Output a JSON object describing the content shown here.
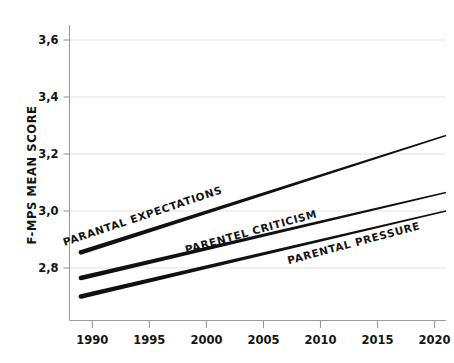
{
  "chart_data": {
    "type": "line",
    "title": "",
    "subtitle": "",
    "xlabel": "",
    "ylabel": "F-MPS MEAN SCORE",
    "xlim": [
      1988,
      2021
    ],
    "ylim": [
      2.66,
      3.68
    ],
    "xticks": [
      "1990",
      "1995",
      "2000",
      "2005",
      "2010",
      "2015",
      "2020"
    ],
    "xtick_values": [
      1990,
      1995,
      2000,
      2005,
      2010,
      2015,
      2020
    ],
    "yticks": [
      "2,8",
      "3,0",
      "3,2",
      "3,4",
      "3,6"
    ],
    "ytick_values": [
      2.8,
      3.0,
      3.2,
      3.4,
      3.6
    ],
    "grid": true,
    "grid_axis": "y",
    "legend": "inline-labels",
    "x": [
      1989,
      2021
    ],
    "series": [
      {
        "name": "PARANTAL EXPECTATIONS",
        "label": "PARANTAL EXPECTATIONS",
        "values": [
          2.855,
          3.265
        ],
        "color": "#111111"
      },
      {
        "name": "PARENTEL CRITICISM",
        "label": "PARENTEL CRITICISM",
        "values": [
          2.765,
          3.065
        ],
        "color": "#111111"
      },
      {
        "name": "PARENTAL PRESSURE",
        "label": "PARENTAL PRESSURE",
        "values": [
          2.7,
          3.0
        ],
        "color": "#111111"
      }
    ],
    "annotations": [
      {
        "text": "PARANTAL EXPECTATIONS",
        "x": 1994.5,
        "y": 2.97,
        "rotation": -18.5
      },
      {
        "text": "PARENTEL CRITICISM",
        "x": 2004.0,
        "y": 2.915,
        "rotation": -15.5
      },
      {
        "text": "PARENTAL PRESSURE",
        "x": 2013.0,
        "y": 2.875,
        "rotation": -15.0
      }
    ],
    "colors": {
      "line": "#111111",
      "axis": "#8a8a8a",
      "grid": "#e3e3e3",
      "text": "#141414",
      "background": "#ffffff"
    }
  }
}
